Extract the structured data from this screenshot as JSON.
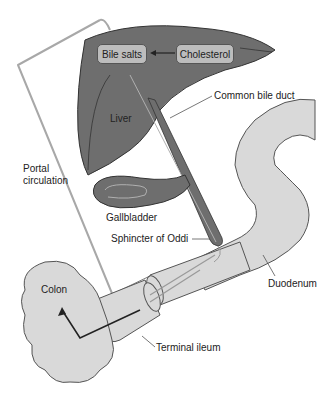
{
  "diagram": {
    "boxes": {
      "bile_salts": "Bile salts",
      "cholesterol": "Cholesterol"
    },
    "labels": {
      "liver": "Liver",
      "common_bile_duct": "Common bile duct",
      "portal_circulation": "Portal circulation",
      "gallbladder": "Gallbladder",
      "sphincter_of_oddi": "Sphincter of Oddi",
      "duodenum": "Duodenum",
      "colon": "Colon",
      "terminal_ileum": "Terminal ileum"
    },
    "colors": {
      "liver": "#6e6e6e",
      "intestine": "#d9d9d9",
      "box": "#bdbdbd",
      "flow_line": "#a0a0a0"
    }
  }
}
